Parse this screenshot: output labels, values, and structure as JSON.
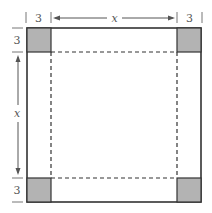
{
  "diagram": {
    "type": "square-with-corner-cutouts",
    "labels": {
      "top_left_corner_width": "3",
      "top_side_length": "x",
      "top_right_corner_width": "3",
      "left_top_corner_height": "3",
      "left_side_length": "x",
      "left_bottom_corner_height": "3"
    },
    "colors": {
      "corner_fill": "#b3b3b3",
      "outline": "#333333",
      "dimension_line": "#777777",
      "background": "#ffffff"
    },
    "geometry": {
      "outer": {
        "x": 27,
        "y": 28,
        "size": 174
      },
      "corner_size": 24
    }
  }
}
